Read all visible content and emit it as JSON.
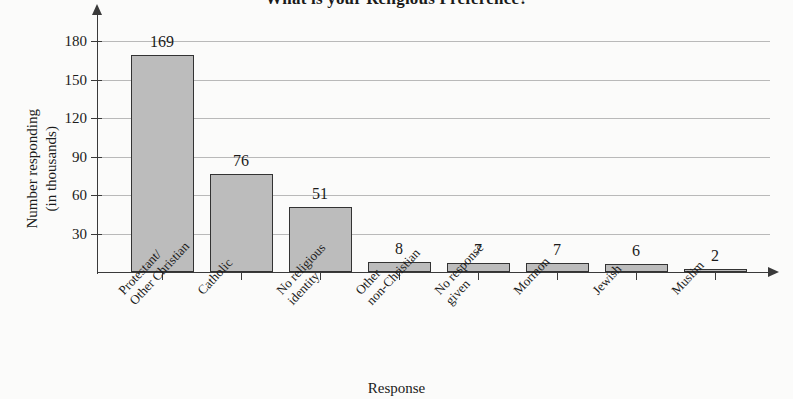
{
  "chart_data": {
    "type": "bar",
    "title": "What is your Religious Preference?",
    "xlabel": "Response",
    "ylabel": "Number responding\n(in thousands)",
    "categories": [
      "Protestant/\nOther Christian",
      "Catholic",
      "No religious\nidentity",
      "Other\nnon-Christian",
      "No response\ngiven",
      "Mormon",
      "Jewish",
      "Muslim"
    ],
    "values": [
      169,
      76,
      51,
      8,
      7,
      7,
      6,
      2
    ],
    "ylim": [
      0,
      195
    ],
    "yticks": [
      30,
      60,
      90,
      120,
      150,
      180
    ],
    "ytick_labels": [
      "30",
      "60",
      "90",
      "120",
      "150",
      "180"
    ],
    "value_labels": [
      "169",
      "76",
      "51",
      "8",
      "7",
      "7",
      "6",
      "2"
    ],
    "grid": true,
    "legend": false,
    "bar_color": "#bcbcbc",
    "bar_border_color": "#333333",
    "axis_color": "#3a3a3a",
    "grid_color": "#b9b9b9",
    "background": "#fbfbfa"
  }
}
